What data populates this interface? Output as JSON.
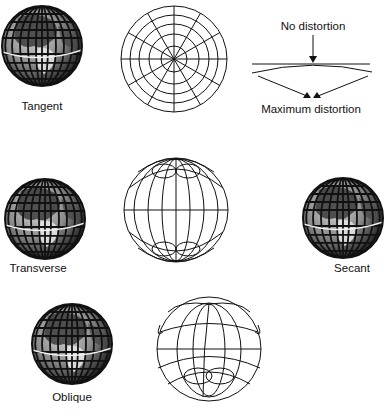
{
  "globes": [
    {
      "id": "tangent",
      "label": "Tangent",
      "cx": 42,
      "cy": 46,
      "r": 40,
      "label_x": 42,
      "label_y": 100
    },
    {
      "id": "transverse",
      "label": "Transverse",
      "cx": 45,
      "cy": 219,
      "r": 40,
      "label_x": 38,
      "label_y": 262
    },
    {
      "id": "secant",
      "label": "Secant",
      "cx": 343,
      "cy": 218,
      "r": 40,
      "label_x": 352,
      "label_y": 262
    },
    {
      "id": "oblique",
      "label": "Oblique",
      "cx": 72,
      "cy": 344,
      "r": 40,
      "label_x": 72,
      "label_y": 391
    }
  ],
  "grids": [
    {
      "id": "polar-azimuthal-grid",
      "cx": 174,
      "cy": 59,
      "r": 53
    },
    {
      "id": "transverse-grid",
      "cx": 176,
      "cy": 210,
      "r": 52
    },
    {
      "id": "oblique-grid",
      "cx": 209,
      "cy": 349,
      "r": 52
    }
  ],
  "distortion_diagram": {
    "top_label": "No distortion",
    "bottom_label": "Maximum distortion"
  },
  "colors": {
    "line": "#111111",
    "globe_dark": "#2a2a2a",
    "globe_light": "#bdbdbd"
  }
}
